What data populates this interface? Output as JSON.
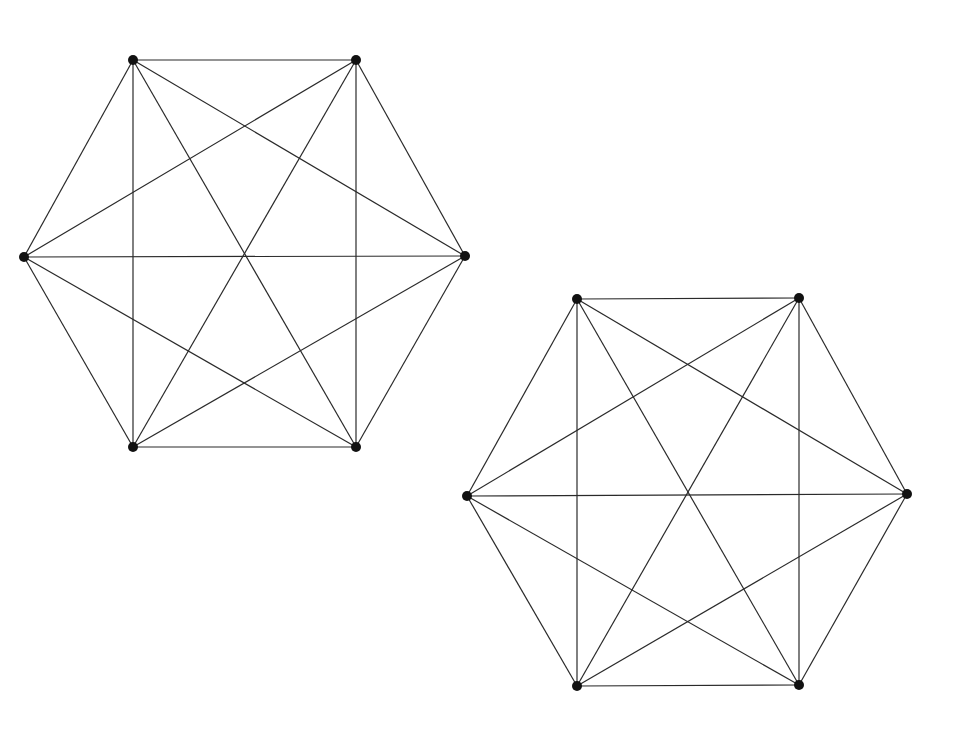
{
  "diagram": {
    "type": "graph-drawing",
    "colors": {
      "edge": "#2a2a2a",
      "node": "#111111",
      "background": "#ffffff"
    },
    "node_radius": 5,
    "graphs": [
      {
        "name": "graph-1",
        "nodes": [
          {
            "id": "a",
            "x": 133,
            "y": 60
          },
          {
            "id": "b",
            "x": 356,
            "y": 60
          },
          {
            "id": "c",
            "x": 465,
            "y": 256
          },
          {
            "id": "d",
            "x": 356,
            "y": 447
          },
          {
            "id": "e",
            "x": 133,
            "y": 447
          },
          {
            "id": "f",
            "x": 24,
            "y": 257
          }
        ],
        "complete": true
      },
      {
        "name": "graph-2",
        "nodes": [
          {
            "id": "a",
            "x": 577,
            "y": 299
          },
          {
            "id": "b",
            "x": 799,
            "y": 298
          },
          {
            "id": "c",
            "x": 907,
            "y": 494
          },
          {
            "id": "d",
            "x": 799,
            "y": 685
          },
          {
            "id": "e",
            "x": 577,
            "y": 686
          },
          {
            "id": "f",
            "x": 467,
            "y": 496
          }
        ],
        "complete": true
      }
    ]
  }
}
